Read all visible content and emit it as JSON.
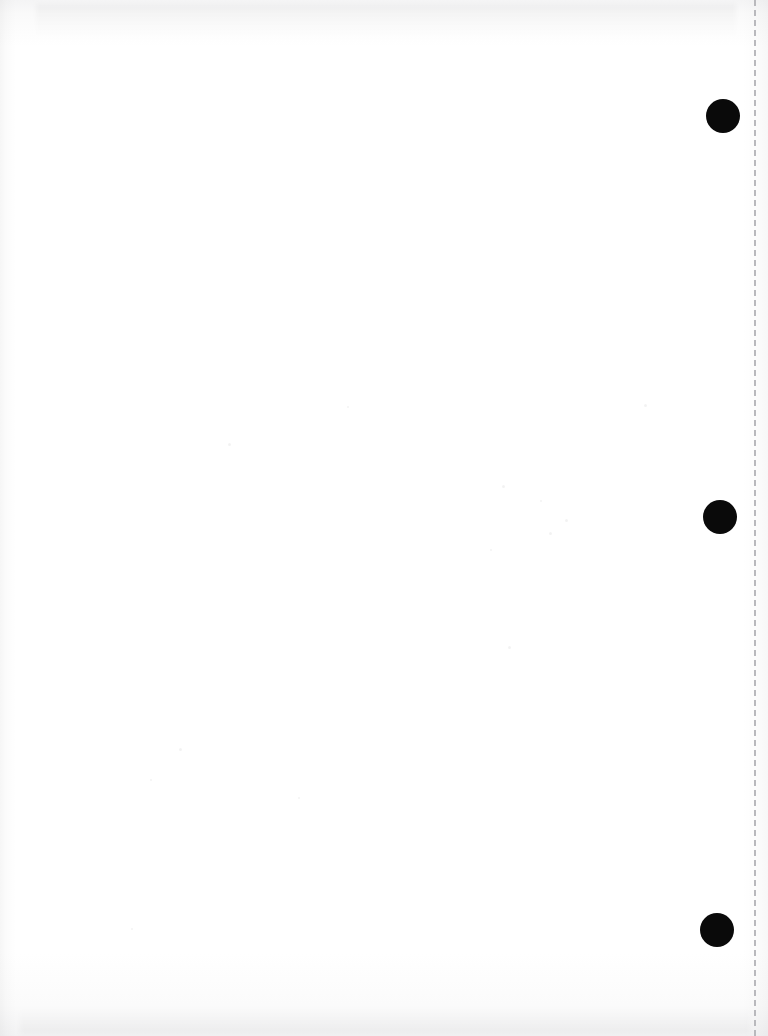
{
  "document": {
    "title": "Scanned blank page",
    "page_width": 768,
    "page_height": 1036,
    "background_color": "#ffffff",
    "paper_tone": "#fafafa",
    "content_text": "",
    "description": "Blank scanned sheet with three black binding punch marks along the right margin and a vertical dashed perforation line near the right edge."
  },
  "perforation_line": {
    "name": "dashed-fold-line",
    "x": 754,
    "top": 0,
    "height": 1036,
    "color": "#b9b9bd",
    "dash_length": 5,
    "dash_gap": 4,
    "thickness": 2
  },
  "punch_holes": [
    {
      "label": "top-hole",
      "cx": 723,
      "cy": 116,
      "r": 17,
      "color": "#0a0a0a"
    },
    {
      "label": "middle-hole",
      "cx": 720,
      "cy": 517,
      "r": 17,
      "color": "#0a0a0a"
    },
    {
      "label": "bottom-hole",
      "cx": 717,
      "cy": 930,
      "r": 17,
      "color": "#0a0a0a"
    }
  ],
  "scan_artifacts": {
    "top_smudge": "faint horizontal gray band across the top margin",
    "bottom_smudge": "faint horizontal gray band across the bottom margin",
    "left_edge_shadow": "faint vertical gradient along the left edge",
    "right_edge_shadow": "faint vertical gradient along the right edge",
    "specks": [
      {
        "x": 228,
        "y": 443,
        "d": 3
      },
      {
        "x": 502,
        "y": 485,
        "d": 3
      },
      {
        "x": 540,
        "y": 500,
        "d": 2
      },
      {
        "x": 565,
        "y": 519,
        "d": 3
      },
      {
        "x": 549,
        "y": 532,
        "d": 3
      },
      {
        "x": 490,
        "y": 549,
        "d": 2
      },
      {
        "x": 508,
        "y": 646,
        "d": 3
      },
      {
        "x": 179,
        "y": 748,
        "d": 3
      },
      {
        "x": 150,
        "y": 779,
        "d": 2
      },
      {
        "x": 298,
        "y": 797,
        "d": 2
      },
      {
        "x": 131,
        "y": 928,
        "d": 2
      },
      {
        "x": 347,
        "y": 406,
        "d": 2
      },
      {
        "x": 644,
        "y": 404,
        "d": 3
      }
    ]
  }
}
